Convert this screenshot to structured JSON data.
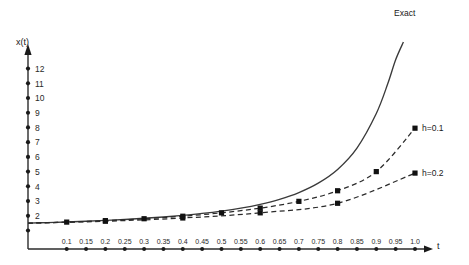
{
  "chart_data": {
    "type": "line",
    "title": "",
    "xlabel": "t",
    "ylabel": "x(t)",
    "xlim": [
      0.0,
      1.0
    ],
    "ylim": [
      0,
      12.6
    ],
    "grid": false,
    "legend_position": "right-inline",
    "xticks": [
      "0.1",
      "0.15",
      "0.2",
      "0.25",
      "0.3",
      "0.35",
      "0.4",
      "0.45",
      "0.5",
      "0.55",
      "0.6",
      "0.65",
      "0.7",
      "0.75",
      "0.8",
      "0.85",
      "0.9",
      "0.95",
      "1.0"
    ],
    "xtick_values": [
      0.1,
      0.15,
      0.2,
      0.25,
      0.3,
      0.35,
      0.4,
      0.45,
      0.5,
      0.55,
      0.6,
      0.65,
      0.7,
      0.75,
      0.8,
      0.85,
      0.9,
      0.95,
      1.0
    ],
    "yticks": [
      "2",
      "3",
      "4",
      "5",
      "6",
      "7",
      "8",
      "9",
      "10",
      "11",
      "12"
    ],
    "ytick_values": [
      2,
      3,
      4,
      5,
      6,
      7,
      8,
      9,
      10,
      11,
      12
    ],
    "series": [
      {
        "name": "Exact",
        "style": "solid",
        "markers": false,
        "x": [
          0.0,
          0.05,
          0.1,
          0.15,
          0.2,
          0.25,
          0.3,
          0.35,
          0.4,
          0.45,
          0.5,
          0.55,
          0.6,
          0.65,
          0.7,
          0.75,
          0.8,
          0.85,
          0.9,
          0.93,
          0.95,
          0.97
        ],
        "y": [
          1.5,
          1.54,
          1.58,
          1.63,
          1.69,
          1.75,
          1.83,
          1.92,
          2.03,
          2.16,
          2.32,
          2.52,
          2.78,
          3.12,
          3.58,
          4.22,
          5.15,
          6.6,
          8.95,
          11.0,
          12.6,
          13.8
        ]
      },
      {
        "name": "h=0.1",
        "style": "dashed",
        "markers": true,
        "x": [
          0.0,
          0.1,
          0.2,
          0.3,
          0.4,
          0.5,
          0.6,
          0.7,
          0.8,
          0.9,
          1.0
        ],
        "y": [
          1.5,
          1.57,
          1.67,
          1.8,
          1.97,
          2.2,
          2.52,
          2.98,
          3.7,
          5.0,
          7.95
        ]
      },
      {
        "name": "h=0.2",
        "style": "dashed",
        "markers": true,
        "x": [
          0.0,
          0.2,
          0.4,
          0.6,
          0.8,
          1.0
        ],
        "y": [
          1.5,
          1.63,
          1.85,
          2.2,
          2.85,
          4.9
        ]
      }
    ]
  },
  "labels": {
    "exact": "Exact",
    "h01": "h=0.1",
    "h02": "h=0.2",
    "y_axis": "x(t)",
    "x_axis": "t"
  }
}
